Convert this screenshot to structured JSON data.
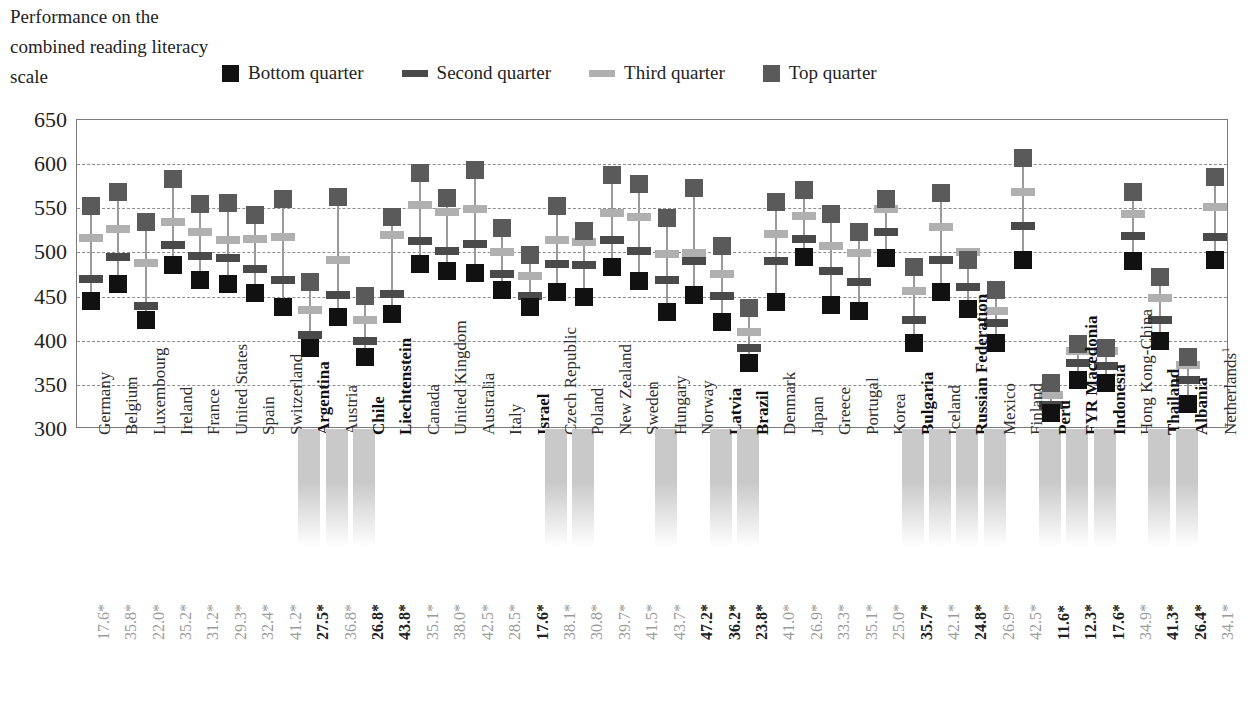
{
  "caption": "Performance on the combined reading literacy scale",
  "legend": {
    "position": "top",
    "items": [
      {
        "label": "Bottom quarter",
        "marker": "square",
        "color": "#111111"
      },
      {
        "label": "Second quarter",
        "marker": "bar",
        "color": "#4a4a4a"
      },
      {
        "label": "Third quarter",
        "marker": "bar",
        "color": "#b0b0b0"
      },
      {
        "label": "Top quarter",
        "marker": "square",
        "color": "#5a5a5a"
      }
    ]
  },
  "colors": {
    "bottom_quarter": "#111111",
    "second_quarter": "#4a4a4a",
    "third_quarter": "#b0b0b0",
    "top_quarter": "#5a5a5a",
    "stem": "#9a9a9a",
    "gridline": "#8d8d8d",
    "frame": "#7a7a7a",
    "shade_band": "#c9c9c9",
    "pct_text": "#9b9b9b",
    "pct_text_bold": "#222222"
  },
  "chart_data": {
    "type": "scatter",
    "title": "Performance on the combined reading literacy scale",
    "xlabel": "",
    "ylabel": "",
    "ylim": [
      300,
      650
    ],
    "yticks": [
      300,
      350,
      400,
      450,
      500,
      550,
      600,
      650
    ],
    "grid": true,
    "legend_position": "top",
    "series_names": [
      "Bottom quarter",
      "Second quarter",
      "Third quarter",
      "Top quarter"
    ],
    "categories": [
      "Germany",
      "Belgium",
      "Luxembourg",
      "Ireland",
      "France",
      "United States",
      "Spain",
      "Switzerland",
      "Argentina",
      "Austria",
      "Chile",
      "Liechtenstein",
      "Canada",
      "United Kingdom",
      "Australia",
      "Italy",
      "Israel",
      "Czech Republic",
      "Poland",
      "New Zealand",
      "Sweden",
      "Hungary",
      "Norway",
      "Latvia",
      "Brazil",
      "Denmark",
      "Japan",
      "Greece",
      "Portugal",
      "Korea",
      "Bulgaria",
      "Iceland",
      "Russian Federation",
      "Mexico",
      "Finland",
      "Peru",
      "FYR Macedonia",
      "Indonesia",
      "Hong Kong-China",
      "Thailand",
      "Albania",
      "Netherlands"
    ],
    "category_bold": [
      false,
      false,
      false,
      false,
      false,
      false,
      false,
      false,
      true,
      false,
      true,
      true,
      false,
      false,
      false,
      false,
      true,
      false,
      false,
      false,
      false,
      false,
      false,
      true,
      true,
      false,
      false,
      false,
      false,
      false,
      true,
      false,
      true,
      false,
      false,
      true,
      true,
      true,
      false,
      true,
      true,
      false
    ],
    "category_shaded": [
      false,
      false,
      false,
      false,
      false,
      false,
      false,
      false,
      true,
      true,
      true,
      false,
      false,
      false,
      false,
      false,
      false,
      true,
      true,
      false,
      false,
      true,
      false,
      true,
      true,
      false,
      false,
      false,
      false,
      false,
      true,
      true,
      true,
      true,
      false,
      true,
      true,
      true,
      false,
      true,
      true,
      false
    ],
    "category_footnote": {
      "Netherlands": "1"
    },
    "percent_row_label": "",
    "percent_values": [
      "17.6*",
      "35.8*",
      "22.0*",
      "35.2*",
      "31.2*",
      "29.3*",
      "32.4*",
      "41.2*",
      "27.5*",
      "36.8*",
      "26.8*",
      "43.8*",
      "35.1*",
      "38.0*",
      "42.5*",
      "28.5*",
      "17.6*",
      "38.1*",
      "30.8*",
      "39.7*",
      "41.5*",
      "43.7*",
      "47.2*",
      "36.2*",
      "23.8*",
      "41.0*",
      "26.9*",
      "33.3*",
      "35.1*",
      "25.0*",
      "35.7*",
      "42.1*",
      "24.8*",
      "26.9*",
      "42.5*",
      "11.6*",
      "12.3*",
      "17.6*",
      "34.9*",
      "41.3*",
      "26.4*",
      "34.1*"
    ],
    "percent_bold": [
      false,
      false,
      false,
      false,
      false,
      false,
      false,
      false,
      true,
      false,
      true,
      true,
      false,
      false,
      false,
      false,
      true,
      false,
      false,
      false,
      false,
      false,
      true,
      true,
      true,
      false,
      false,
      false,
      false,
      false,
      true,
      false,
      true,
      false,
      false,
      true,
      true,
      true,
      false,
      true,
      true,
      false
    ],
    "series": [
      {
        "name": "Bottom quarter",
        "values": [
          445,
          464,
          423,
          486,
          469,
          464,
          454,
          438,
          392,
          427,
          381,
          430,
          487,
          479,
          477,
          457,
          438,
          455,
          450,
          484,
          468,
          433,
          452,
          421,
          375,
          444,
          495,
          440,
          434,
          494,
          397,
          455,
          436,
          397,
          491,
          318,
          356,
          352,
          490,
          400,
          328,
          491
        ]
      },
      {
        "name": "Second quarter",
        "values": [
          470,
          495,
          439,
          508,
          496,
          494,
          481,
          469,
          406,
          452,
          400,
          453,
          513,
          502,
          510,
          476,
          451,
          487,
          486,
          514,
          502,
          469,
          490,
          451,
          392,
          490,
          515,
          479,
          467,
          523,
          424,
          491,
          461,
          420,
          530,
          327,
          375,
          371,
          519,
          424,
          355,
          518
        ]
      },
      {
        "name": "Third quarter",
        "values": [
          516,
          526,
          488,
          534,
          523,
          514,
          515,
          517,
          435,
          491,
          424,
          520,
          554,
          546,
          549,
          501,
          473,
          514,
          512,
          545,
          540,
          498,
          499,
          476,
          410,
          521,
          541,
          507,
          499,
          549,
          456,
          529,
          500,
          434,
          569,
          338,
          388,
          388,
          543,
          448,
          373,
          551
        ]
      },
      {
        "name": "Top quarter",
        "values": [
          553,
          568,
          535,
          583,
          555,
          556,
          542,
          560,
          467,
          563,
          451,
          540,
          590,
          562,
          593,
          528,
          497,
          553,
          524,
          588,
          577,
          539,
          573,
          507,
          437,
          557,
          571,
          544,
          523,
          561,
          483,
          567,
          491,
          458,
          607,
          352,
          396,
          392,
          568,
          472,
          381,
          585
        ]
      }
    ]
  }
}
